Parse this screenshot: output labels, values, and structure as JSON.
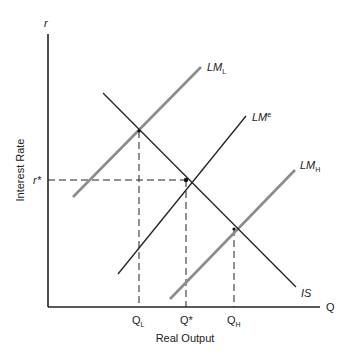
{
  "diagram": {
    "type": "IS-LM diagram",
    "axes": {
      "y_symbol": "r",
      "y_label": "Interest Rate",
      "x_symbol": "Q",
      "x_label": "Real Output"
    },
    "curves": {
      "is": {
        "label": "IS",
        "color": "#222222"
      },
      "lm_e": {
        "label": "LM",
        "sup": "e",
        "color": "#222222"
      },
      "lm_l": {
        "label": "LM",
        "sub": "L",
        "color": "#8c8c8c"
      },
      "lm_h": {
        "label": "LM",
        "sub": "H",
        "color": "#8c8c8c"
      }
    },
    "levels": {
      "r_star": "r*",
      "q_l": {
        "base": "Q",
        "sub": "L"
      },
      "q_star": "Q*",
      "q_h": {
        "base": "Q",
        "sub": "H"
      }
    }
  }
}
